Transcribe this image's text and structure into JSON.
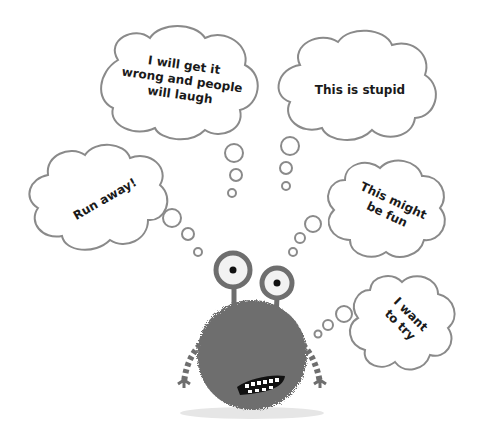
{
  "thoughts": [
    {
      "id": "wrong",
      "text": "I will get it\nwrong and people\nwill laugh",
      "rotation": 8
    },
    {
      "id": "stupid",
      "text": "This is stupid",
      "rotation": 0
    },
    {
      "id": "run",
      "text": "Run away!",
      "rotation": -30
    },
    {
      "id": "fun",
      "text": "This might\nbe fun",
      "rotation": 25
    },
    {
      "id": "try",
      "text": "I want\nto try",
      "rotation": 45
    }
  ],
  "colors": {
    "outline": "#8a8a8a",
    "monster": "#6e6e6e",
    "monster_dark": "#555555",
    "eye_white": "#f2f2f2",
    "pupil": "#111111",
    "shadow": "#e6e6e6"
  }
}
